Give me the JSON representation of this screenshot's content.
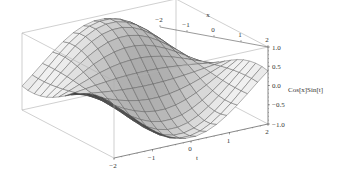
{
  "chart_data": {
    "type": "surface3d",
    "title": "",
    "function": "Cos[x] Sin[t]",
    "x_axis": {
      "label": "x",
      "range": [
        -2,
        2
      ],
      "ticks": [
        "-2",
        "-1",
        "0",
        "1",
        "2"
      ]
    },
    "t_axis": {
      "label": "t",
      "range": [
        -2,
        2
      ],
      "ticks": [
        "-2",
        "-1",
        "0",
        "1",
        "2"
      ]
    },
    "z_axis": {
      "label": "Cos[x]Sin[t]",
      "range": [
        -1.0,
        1.0
      ],
      "ticks": [
        "1.0",
        "0.5",
        "0.0",
        "-0.5",
        "-1.0"
      ]
    },
    "mesh": {
      "x_lines": 15,
      "t_lines": 15
    },
    "grid": false,
    "legend": null,
    "box": true,
    "colors": {
      "surface_light": "#f2f2f2",
      "surface_dark": "#3a3a3a",
      "mesh": "#555555",
      "box": "#b0b0b0",
      "axis": "#555555"
    }
  }
}
